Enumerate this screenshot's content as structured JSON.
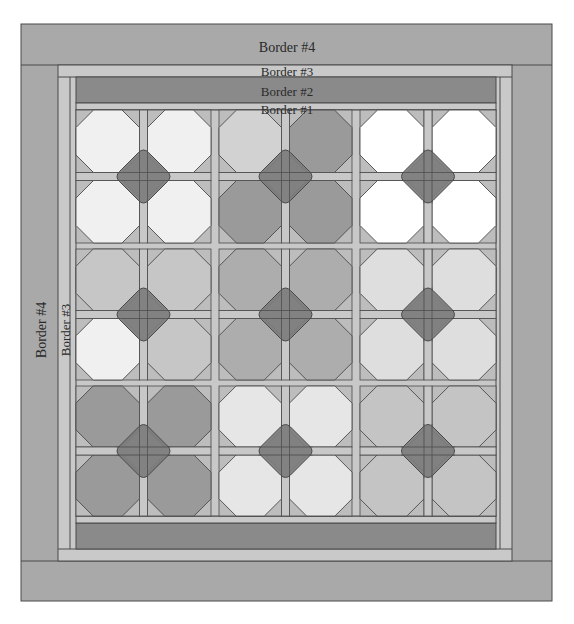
{
  "diagram": {
    "type": "quilt-layout",
    "borders": [
      {
        "id": "border4",
        "label": "Border #4",
        "color": "#a9a9a9"
      },
      {
        "id": "border3",
        "label": "Border #3",
        "color": "#c9c9c9"
      },
      {
        "id": "border2",
        "label": "Border #2",
        "color": "#8a8a8a"
      },
      {
        "id": "border1",
        "label": "Border #1",
        "color": "#c9c9c9"
      }
    ],
    "side_labels": {
      "left_border4": "Border #4",
      "left_border3": "Border #3"
    },
    "colors": {
      "outline": "#4a4a4a",
      "sashing": "#c8c8c8",
      "corner_triangle": "#bdbdbd",
      "center_diamond": "#7c7c7c"
    },
    "grid": {
      "rows": 3,
      "cols": 3,
      "octagons_per_block": "2x2"
    },
    "blocks": [
      {
        "row": 0,
        "col": 0,
        "octagons": [
          "#f0f0f0",
          "#f0f0f0",
          "#f0f0f0",
          "#f0f0f0"
        ]
      },
      {
        "row": 0,
        "col": 1,
        "octagons": [
          "#d2d2d2",
          "#9a9a9a",
          "#9a9a9a",
          "#9a9a9a"
        ]
      },
      {
        "row": 0,
        "col": 2,
        "octagons": [
          "#ffffff",
          "#ffffff",
          "#ffffff",
          "#ffffff"
        ]
      },
      {
        "row": 1,
        "col": 0,
        "octagons": [
          "#c6c6c6",
          "#c6c6c6",
          "#f0f0f0",
          "#c6c6c6"
        ]
      },
      {
        "row": 1,
        "col": 1,
        "octagons": [
          "#adadad",
          "#adadad",
          "#adadad",
          "#adadad"
        ]
      },
      {
        "row": 1,
        "col": 2,
        "octagons": [
          "#dedede",
          "#dedede",
          "#dedede",
          "#dedede"
        ]
      },
      {
        "row": 2,
        "col": 0,
        "octagons": [
          "#9a9a9a",
          "#9a9a9a",
          "#9a9a9a",
          "#9a9a9a"
        ]
      },
      {
        "row": 2,
        "col": 1,
        "octagons": [
          "#e6e6e6",
          "#e6e6e6",
          "#e6e6e6",
          "#e6e6e6"
        ]
      },
      {
        "row": 2,
        "col": 2,
        "octagons": [
          "#c4c4c4",
          "#c4c4c4",
          "#c4c4c4",
          "#c4c4c4"
        ]
      }
    ]
  }
}
